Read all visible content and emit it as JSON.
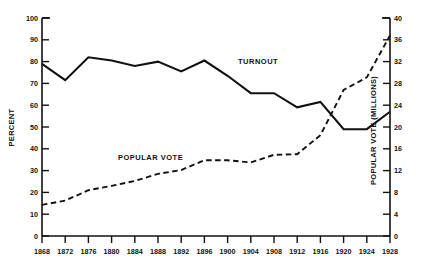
{
  "chart_data": {
    "type": "line",
    "title": "",
    "subtitle": "",
    "xlabel": "",
    "x": [
      1868,
      1872,
      1876,
      1880,
      1884,
      1888,
      1892,
      1896,
      1900,
      1904,
      1908,
      1912,
      1916,
      1920,
      1924,
      1928
    ],
    "xticklabels": [
      "1868",
      "1872",
      "1876",
      "1880",
      "1884",
      "1888",
      "1892",
      "1896",
      "1900",
      "1904",
      "1908",
      "1912",
      "1916",
      "1920",
      "1924",
      "1928"
    ],
    "xlim": [
      1868,
      1928
    ],
    "grid": false,
    "legend_position": "inline-annotations",
    "annotations": [
      {
        "text": "TURNOUT",
        "x": 1916,
        "y_axis": "left"
      },
      {
        "text": "POPULAR VOTE",
        "x": 1888,
        "y_axis": "right"
      }
    ],
    "axes": {
      "left": {
        "label": "PERCENT",
        "ylim": [
          0,
          100
        ],
        "ticks": [
          0,
          10,
          20,
          30,
          40,
          50,
          60,
          70,
          80,
          90,
          100
        ],
        "ticklabels": [
          "0",
          "10",
          "20",
          "30",
          "40",
          "50",
          "60",
          "70",
          "80",
          "90",
          "100"
        ]
      },
      "right": {
        "label": "POPULAR VOTE (MILLIONS)",
        "ylim": [
          0,
          40
        ],
        "ticks": [
          0,
          4,
          8,
          12,
          16,
          20,
          24,
          28,
          32,
          36,
          40
        ],
        "ticklabels": [
          "0",
          "4",
          "8",
          "12",
          "16",
          "20",
          "24",
          "28",
          "32",
          "36",
          "40"
        ]
      }
    },
    "series": [
      {
        "name": "TURNOUT",
        "axis": "left",
        "unit": "percent",
        "style": "solid",
        "color": "#111111",
        "values": [
          79,
          71.5,
          82,
          80.5,
          78,
          80,
          75.5,
          80.5,
          73.5,
          65.5,
          65.5,
          59,
          61.5,
          49,
          49,
          57
        ]
      },
      {
        "name": "POPULAR VOTE",
        "axis": "right",
        "unit": "millions",
        "style": "dashed",
        "color": "#111111",
        "values": [
          5.7,
          6.5,
          8.4,
          9.2,
          10.1,
          11.4,
          12.1,
          13.9,
          13.9,
          13.5,
          14.9,
          15.0,
          18.5,
          26.8,
          29.1,
          36.8
        ]
      }
    ]
  }
}
